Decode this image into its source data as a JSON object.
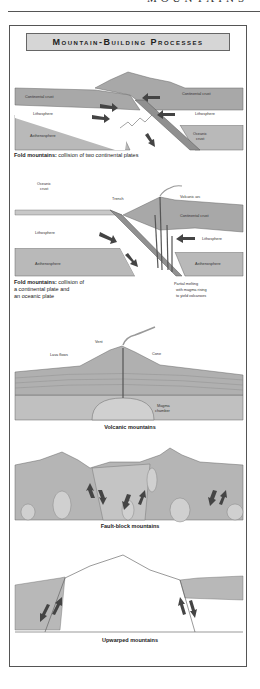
{
  "page_header": {
    "title": "MOUNTAINS"
  },
  "figure": {
    "title": "Mountain-Building Processes",
    "panels": [
      {
        "id": "fold-continental",
        "caption_bold": "Fold mountains:",
        "caption_text": "collision of two continental plates",
        "labels": {
          "continental_crust_left": "Continental crust",
          "continental_crust_right": "Continental crust",
          "lithosphere_left": "Lithosphere",
          "lithosphere_right": "Lithosphere",
          "asthenosphere": "Asthenosphere",
          "oceanic_crust_1": "Oceanic",
          "oceanic_crust_2": "crust"
        }
      },
      {
        "id": "fold-oceanic",
        "caption_bold": "Fold mountains:",
        "caption_line1": "collision of",
        "caption_line2": "a continental plate and",
        "caption_line3": "an oceanic plate",
        "labels": {
          "oceanic_crust_1": "Oceanic",
          "oceanic_crust_2": "crust",
          "trench": "Trench",
          "volcanic_arc": "Volcanic arc",
          "continental_crust": "Continental crust",
          "lithosphere_left": "Lithosphere",
          "lithosphere_right": "Lithosphere",
          "asthenosphere_left": "Asthenosphere",
          "asthenosphere_right": "Asthenosphere",
          "partial_melting_1": "Partial melting",
          "partial_melting_2": "with magma rising",
          "partial_melting_3": "to yield volcanoes"
        }
      },
      {
        "id": "volcanic",
        "caption": "Volcanic mountains",
        "labels": {
          "vent": "Vent",
          "lava_flows": "Lava flows",
          "cone": "Cone",
          "magma_1": "Magma",
          "magma_2": "chamber"
        }
      },
      {
        "id": "fault-block",
        "caption": "Fault-block mountains"
      },
      {
        "id": "upwarped",
        "caption": "Upwarped mountains"
      }
    ]
  },
  "colors": {
    "crust": "#a8a8a8",
    "lithosphere": "#ffffff",
    "asthenosphere": "#b9b9b9",
    "arrow": "#444444",
    "outline": "#555555",
    "banner": "#d6d6d6"
  }
}
